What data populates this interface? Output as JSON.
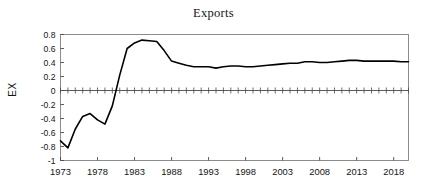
{
  "chart_data": {
    "type": "line",
    "title": "Exports",
    "xlabel": "",
    "ylabel": "EX",
    "xlim": [
      1973,
      2020
    ],
    "ylim": [
      -1,
      0.8
    ],
    "grid": false,
    "legend": null,
    "y_ticks": [
      "0.8",
      "0.6",
      "0.4",
      "0.2",
      "0",
      "-0.2",
      "-0.4",
      "-0.6",
      "-0.8",
      "-1"
    ],
    "y_tick_values": [
      0.8,
      0.6,
      0.4,
      0.2,
      0,
      -0.2,
      -0.4,
      -0.6,
      -0.8,
      -1
    ],
    "x_ticks": [
      "1973",
      "1978",
      "1983",
      "1988",
      "1993",
      "1998",
      "2003",
      "2008",
      "2013",
      "2018"
    ],
    "x_tick_values": [
      1973,
      1978,
      1983,
      1988,
      1993,
      1998,
      2003,
      2008,
      2013,
      2018
    ],
    "zero_axis_ticks": true,
    "line_color": "#000000",
    "axis_color": "#808080",
    "series": [
      {
        "name": "EX",
        "x": [
          1973,
          1974,
          1975,
          1976,
          1977,
          1978,
          1979,
          1980,
          1981,
          1982,
          1983,
          1984,
          1985,
          1986,
          1987,
          1988,
          1989,
          1990,
          1991,
          1992,
          1993,
          1994,
          1995,
          1996,
          1997,
          1998,
          1999,
          2000,
          2001,
          2002,
          2003,
          2004,
          2005,
          2006,
          2007,
          2008,
          2009,
          2010,
          2011,
          2012,
          2013,
          2014,
          2015,
          2016,
          2017,
          2018,
          2019,
          2020
        ],
        "values": [
          -0.72,
          -0.82,
          -0.55,
          -0.37,
          -0.33,
          -0.42,
          -0.48,
          -0.22,
          0.22,
          0.6,
          0.68,
          0.72,
          0.71,
          0.7,
          0.57,
          0.42,
          0.39,
          0.36,
          0.34,
          0.34,
          0.34,
          0.32,
          0.34,
          0.35,
          0.35,
          0.34,
          0.34,
          0.35,
          0.36,
          0.37,
          0.38,
          0.39,
          0.39,
          0.41,
          0.41,
          0.4,
          0.4,
          0.41,
          0.42,
          0.43,
          0.43,
          0.42,
          0.42,
          0.42,
          0.42,
          0.42,
          0.41,
          0.41
        ]
      }
    ]
  },
  "figure": {
    "title": "Exports",
    "y_axis_label": "EX"
  }
}
